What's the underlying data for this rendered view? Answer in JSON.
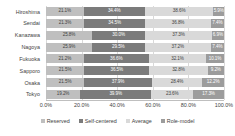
{
  "chart_data": {
    "type": "bar",
    "orientation": "horizontal",
    "stacked": true,
    "stack_mode": "percent",
    "title": "",
    "xlabel": "",
    "ylabel": "",
    "xlim": [
      0,
      100
    ],
    "grid": true,
    "legend_position": "bottom",
    "categories": [
      "Hiroshima",
      "Sendai",
      "Kanazawa",
      "Nagoya",
      "Fukuoka",
      "Sapporo",
      "Osaka",
      "Tokyo"
    ],
    "xticks": [
      "0.0%",
      "20.0%",
      "40.0%",
      "60.0%",
      "80.0%",
      "100.0%"
    ],
    "xtick_values": [
      0,
      20,
      40,
      60,
      80,
      100
    ],
    "series": [
      {
        "name": "Reserved",
        "color": "#bfbfbf",
        "values": [
          21.1,
          21.3,
          25.8,
          25.9,
          21.2,
          21.5,
          21.5,
          19.2
        ],
        "labels": [
          "21.1%",
          "21.3%",
          "25.8%",
          "25.9%",
          "21.2%",
          "21.5%",
          "21.5%",
          "19.2%"
        ]
      },
      {
        "name": "Self-centered",
        "color": "#7b7b7b",
        "values": [
          34.4,
          34.5,
          30.0,
          29.5,
          36.6,
          36.5,
          37.9,
          39.9
        ],
        "labels": [
          "34.4%",
          "34.5%",
          "30.0%",
          "29.5%",
          "36.6%",
          "36.5%",
          "37.9%",
          "39.9%"
        ]
      },
      {
        "name": "Average",
        "color": "#d9d9d9",
        "values": [
          38.6,
          36.8,
          37.3,
          37.2,
          32.1,
          32.8,
          28.4,
          23.6
        ],
        "labels": [
          "38.6%",
          "36.8%",
          "37.3%",
          "37.2%",
          "32.1%",
          "32.8%",
          "28.4%",
          "23.6%"
        ]
      },
      {
        "name": "Role-model",
        "color": "#9c9c9c",
        "values": [
          5.9,
          7.4,
          6.9,
          7.4,
          10.1,
          9.2,
          12.2,
          17.3
        ],
        "labels": [
          "5.9%",
          "7.4%",
          "6.9%",
          "7.4%",
          "10.1%",
          "9.2%",
          "12.2%",
          "17.3%"
        ]
      }
    ]
  }
}
